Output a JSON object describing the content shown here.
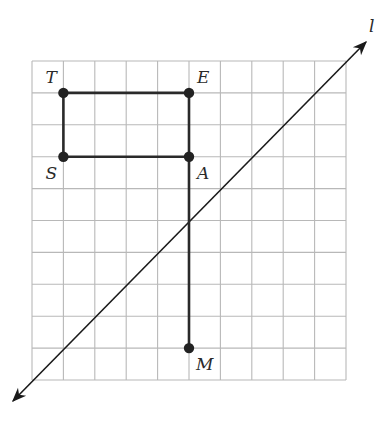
{
  "figure": {
    "grid": {
      "cols": 10,
      "rows": 10,
      "x0": 32,
      "y0": 61,
      "cell_w": 31.4,
      "cell_h": 31.9,
      "color": "#b8b8b8"
    },
    "points": [
      {
        "name": "T",
        "col": 1,
        "row": 1,
        "label_dx": -18,
        "label_dy": -24
      },
      {
        "name": "E",
        "col": 5,
        "row": 1,
        "label_dx": 8,
        "label_dy": -24
      },
      {
        "name": "S",
        "col": 1,
        "row": 3,
        "label_dx": -18,
        "label_dy": 8
      },
      {
        "name": "A",
        "col": 5,
        "row": 3,
        "label_dx": 8,
        "label_dy": 8
      },
      {
        "name": "M",
        "col": 5,
        "row": 9,
        "label_dx": 7,
        "label_dy": 8
      }
    ],
    "segments": [
      [
        "T",
        "E"
      ],
      [
        "E",
        "A"
      ],
      [
        "A",
        "S"
      ],
      [
        "S",
        "T"
      ],
      [
        "A",
        "M"
      ]
    ],
    "line": {
      "name": "l",
      "from": [
        13,
        401
      ],
      "to": [
        366,
        42
      ],
      "label": "l",
      "label_x": 369,
      "label_y": 18
    }
  }
}
